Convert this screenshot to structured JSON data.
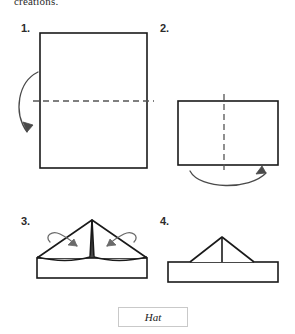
{
  "document": {
    "intro_text": "creations.",
    "caption": "Hat",
    "title_label": "Hat folding instructions"
  },
  "steps": [
    {
      "number": "1.",
      "name": "step-1",
      "shape": "square sheet of paper",
      "fold_line": "horizontal dashed fold line across the middle",
      "fold_line_orientation": "horizontal",
      "arrow": "curved arrow on the left side pointing downward",
      "arrow_direction": "down"
    },
    {
      "number": "2.",
      "name": "step-2",
      "shape": "horizontal rectangle (paper folded in half)",
      "fold_line": "vertical dashed fold line down the middle",
      "fold_line_orientation": "vertical",
      "arrow": "curved arrow below pointing to the right",
      "arrow_direction": "right"
    },
    {
      "number": "3.",
      "name": "step-3",
      "shape": "hat shape with wide triangular top and rectangular brim",
      "fold_line": "vertical center crease line at the peak",
      "arrow": "two small curl arrows folding the top corners inward",
      "arrow_direction": "inward"
    },
    {
      "number": "4.",
      "name": "step-4",
      "shape": "finished hat with narrow triangular crown on a wide brim",
      "fold_line": "vertical center line in the crown",
      "arrow": "",
      "arrow_direction": ""
    }
  ],
  "colors": {
    "stroke": "#1a1a1a",
    "dashed_stroke": "#555555",
    "arrow_stroke": "#4a4a4a",
    "caption_border": "#c9c9c9",
    "background": "#ffffff",
    "text": "#2b2b2b"
  }
}
